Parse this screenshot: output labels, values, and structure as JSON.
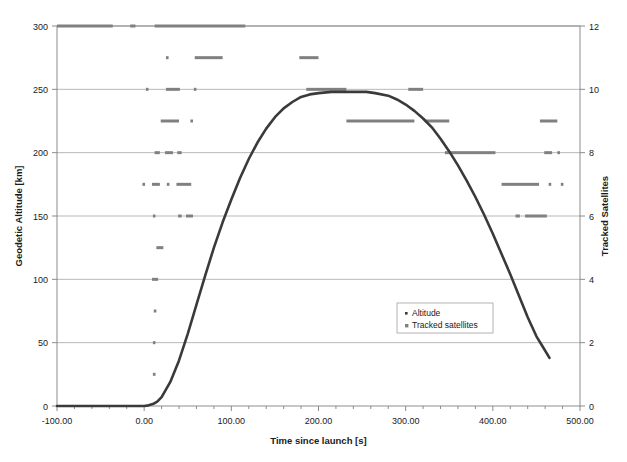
{
  "chart_data": {
    "type": "scatter",
    "title": "",
    "xlabel": "Time since launch [s]",
    "ylabel": "Geodetic Altitude [km]",
    "y2label": "Tracked Satellites",
    "xlim": [
      -100,
      500
    ],
    "ylim": [
      0,
      300
    ],
    "y2lim": [
      0,
      12
    ],
    "xticks": [
      -100,
      0,
      100,
      200,
      300,
      400,
      500
    ],
    "xticklabels": [
      "-100.00",
      "0.00",
      "100.00",
      "200.00",
      "300.00",
      "400.00",
      "500.00"
    ],
    "xminor_step": 20,
    "yticks": [
      0,
      50,
      100,
      150,
      200,
      250,
      300
    ],
    "yticklabels": [
      "0",
      "50",
      "100",
      "150",
      "200",
      "250",
      "300"
    ],
    "y2ticks": [
      0,
      2,
      4,
      6,
      8,
      10,
      12
    ],
    "y2ticklabels": [
      "0",
      "2",
      "4",
      "6",
      "8",
      "10",
      "12"
    ],
    "grid": "horizontal",
    "legend_position": "center-right",
    "series": [
      {
        "name": "Altitude",
        "legend_label": "Altitude",
        "type": "line",
        "axis": "left",
        "color": "#3a3a3a",
        "points": [
          [
            -100,
            0
          ],
          [
            -80,
            0
          ],
          [
            -60,
            0
          ],
          [
            -40,
            0
          ],
          [
            -20,
            0
          ],
          [
            -5,
            0
          ],
          [
            0,
            0
          ],
          [
            5,
            0.5
          ],
          [
            10,
            1.5
          ],
          [
            15,
            3.5
          ],
          [
            20,
            7
          ],
          [
            30,
            19
          ],
          [
            40,
            36
          ],
          [
            50,
            57
          ],
          [
            60,
            80
          ],
          [
            70,
            103
          ],
          [
            80,
            125
          ],
          [
            90,
            145
          ],
          [
            100,
            163
          ],
          [
            110,
            180
          ],
          [
            120,
            195
          ],
          [
            130,
            208
          ],
          [
            140,
            219
          ],
          [
            150,
            228
          ],
          [
            160,
            235
          ],
          [
            170,
            240
          ],
          [
            180,
            244
          ],
          [
            190,
            246
          ],
          [
            200,
            247
          ],
          [
            215,
            248
          ],
          [
            230,
            248
          ],
          [
            245,
            248
          ],
          [
            255,
            248
          ],
          [
            265,
            247
          ],
          [
            280,
            245
          ],
          [
            290,
            242
          ],
          [
            300,
            238
          ],
          [
            310,
            233
          ],
          [
            320,
            227
          ],
          [
            330,
            220
          ],
          [
            340,
            211
          ],
          [
            350,
            201
          ],
          [
            360,
            190
          ],
          [
            370,
            178
          ],
          [
            380,
            165
          ],
          [
            390,
            151
          ],
          [
            400,
            136
          ],
          [
            410,
            120
          ],
          [
            420,
            104
          ],
          [
            430,
            87
          ],
          [
            440,
            70
          ],
          [
            450,
            55
          ],
          [
            458,
            46
          ],
          [
            465,
            38
          ]
        ]
      },
      {
        "name": "Tracked satellites",
        "legend_label": "Tracked satellites",
        "type": "scatter",
        "axis": "right",
        "color": "#808080",
        "note": "Each entry is [t_start, t_end, satellite_count]; equal start/end = single sample point.",
        "segments": [
          [
            -100,
            -36,
            12
          ],
          [
            -16,
            -10,
            12
          ],
          [
            12,
            116,
            12
          ],
          [
            25,
            28,
            11
          ],
          [
            58,
            90,
            11
          ],
          [
            178,
            200,
            11
          ],
          [
            2,
            4,
            10
          ],
          [
            25,
            41,
            10
          ],
          [
            57,
            60,
            10
          ],
          [
            186,
            232,
            10
          ],
          [
            303,
            320,
            10
          ],
          [
            19,
            40,
            9
          ],
          [
            53,
            56,
            9
          ],
          [
            232,
            310,
            9
          ],
          [
            322,
            350,
            9
          ],
          [
            454,
            474,
            9
          ],
          [
            12,
            18,
            8
          ],
          [
            24,
            33,
            8
          ],
          [
            38,
            43,
            8
          ],
          [
            345,
            403,
            8
          ],
          [
            459,
            468,
            8
          ],
          [
            474,
            477,
            8
          ],
          [
            -2,
            1,
            7
          ],
          [
            9,
            18,
            7
          ],
          [
            26,
            28,
            7
          ],
          [
            37,
            54,
            7
          ],
          [
            410,
            453,
            7
          ],
          [
            464,
            466,
            7
          ],
          [
            478,
            480,
            7
          ],
          [
            10,
            12,
            6
          ],
          [
            39,
            43,
            6
          ],
          [
            48,
            56,
            6
          ],
          [
            426,
            431,
            6
          ],
          [
            437,
            462,
            6
          ],
          [
            14,
            22,
            5
          ],
          [
            9,
            16,
            4
          ],
          [
            11,
            14,
            3
          ],
          [
            10,
            12,
            2
          ],
          [
            10,
            13,
            1
          ]
        ]
      }
    ]
  }
}
